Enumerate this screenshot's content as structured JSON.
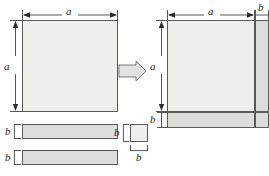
{
  "figure": {
    "title": "",
    "labels": {
      "a": "a",
      "b": "b"
    },
    "colors": {
      "square_fill": "#eeeeec",
      "strip_fill": "#dcdcda",
      "outline": "#595959",
      "dimension_line": "#2b2b2b",
      "arrow_fill": "#e2e2e0",
      "arrow_outline": "#6b6b6b",
      "background": "#ffffff"
    },
    "left_group": {
      "name": "component-pieces",
      "square_a": {
        "label_width": "a",
        "label_height": "a"
      },
      "rect_1": {
        "label_height": "b"
      },
      "rect_2": {
        "label_height": "b"
      },
      "square_b": {
        "label_width": "b",
        "label_height": "b"
      }
    },
    "transform_arrow": {
      "direction": "right",
      "glyph": "block-arrow-right"
    },
    "right_group": {
      "name": "assembled-square",
      "square_a": {
        "label_width": "a",
        "label_height": "a"
      },
      "right_strip": {
        "label_width": "b"
      },
      "bottom_strip": {
        "label_height": "b"
      },
      "corner_square": {
        "label_width": "b",
        "label_height": "b"
      }
    }
  }
}
